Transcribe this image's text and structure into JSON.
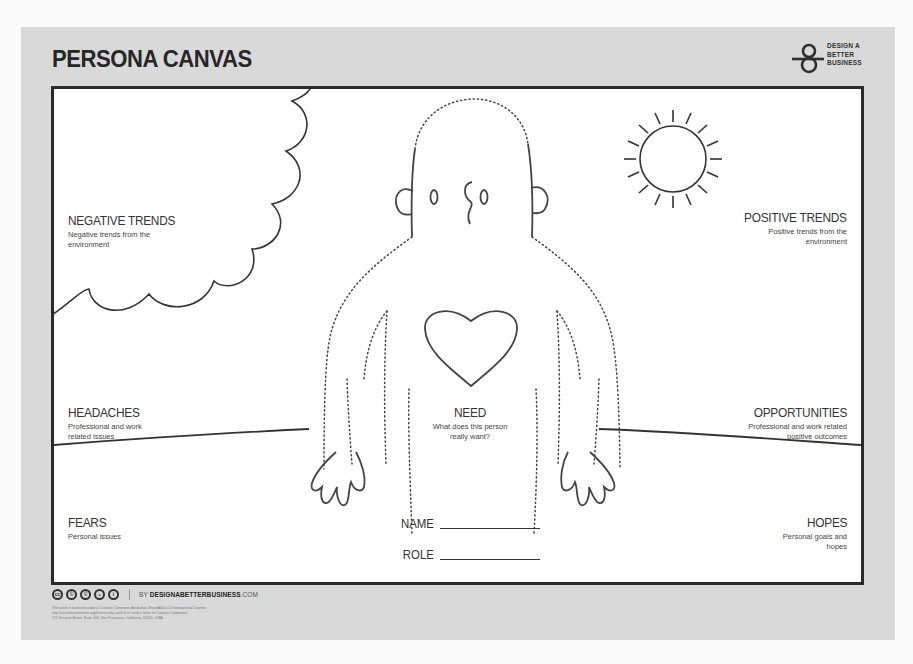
{
  "header": {
    "title": "PERSONA CANVAS",
    "brand": {
      "line1": "DESIGN A",
      "line2": "BETTER",
      "line3": "BUSINESS"
    }
  },
  "sections": {
    "negative_trends": {
      "heading": "NEGATIVE TRENDS",
      "description_line1": "Negative trends from the",
      "description_line2": "environment"
    },
    "positive_trends": {
      "heading": "POSITIVE TRENDS",
      "description_line1": "Positive trends from the",
      "description_line2": "environment"
    },
    "headaches": {
      "heading": "HEADACHES",
      "description_line1": "Professional and work",
      "description_line2": "related issues"
    },
    "need": {
      "heading": "NEED",
      "description_line1": "What does this person",
      "description_line2": "really want?"
    },
    "opportunities": {
      "heading": "OPPORTUNITIES",
      "description_line1": "Professional and work related",
      "description_line2": "positive outcomes"
    },
    "fears": {
      "heading": "FEARS",
      "description_line1": "Personal issues"
    },
    "hopes": {
      "heading": "HOPES",
      "description_line1": "Personal goals and",
      "description_line2": "hopes"
    }
  },
  "fields": {
    "name_label": "NAME",
    "role_label": "ROLE"
  },
  "footer": {
    "cc_icons": [
      "cc",
      "by",
      "nc",
      "sa",
      "attribution"
    ],
    "cc_glyphs": [
      "cc",
      "©",
      "©",
      "◒",
      "i"
    ],
    "site_prefix": "BY",
    "site_name": "DESIGNABETTERBUSINESS",
    "site_suffix": ".COM",
    "license_line1": "This work is licensed under a Creative Commons Attribution-ShareAlike 4.0 International License.",
    "license_line2": "http://creativecommons.org/licenses/by-sa/4.0/ or send a letter to Creative Commons,",
    "license_line3": "171 Second Street, Suite 300, San Francisco, California, 94105, USA."
  },
  "colors": {
    "card_background": "#d9d9d9",
    "frame_border": "#2a2a2a",
    "ink": "#333333"
  }
}
